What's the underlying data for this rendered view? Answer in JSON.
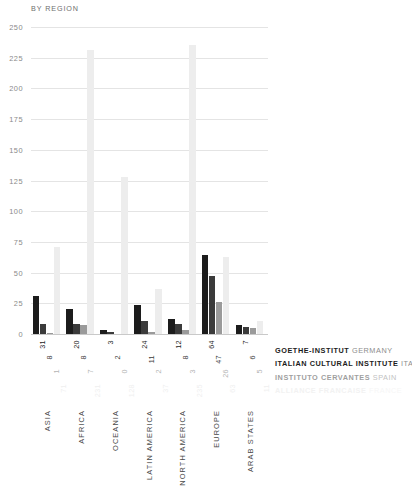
{
  "chart_data": {
    "type": "bar",
    "title": "BY REGION",
    "xlabel": "",
    "ylabel": "",
    "ylim": [
      0,
      250
    ],
    "yticks": [
      250,
      225,
      200,
      175,
      150,
      125,
      100,
      75,
      50,
      25,
      0
    ],
    "grid": true,
    "legend_position": "right-bottom",
    "categories": [
      "ASIA",
      "AFRICA",
      "OCEANIA",
      "LATIN AMERICA",
      "NORTH AMERICA",
      "EUROPE",
      "ARAB STATES"
    ],
    "series": [
      {
        "name": "GOETHE-INSTITUT",
        "country": "GERMANY",
        "color": "#1c1c1c",
        "values": [
          31,
          20,
          3,
          24,
          12,
          64,
          7
        ]
      },
      {
        "name": "ITALIAN CULTURAL INSTITUTE",
        "country": "ITALY",
        "color": "#3b3b3b",
        "values": [
          8,
          8,
          2,
          11,
          8,
          47,
          6
        ]
      },
      {
        "name": "INSTITUTO CERVANTES",
        "country": "SPAIN",
        "color": "#9a9a9a",
        "values": [
          1,
          7,
          0,
          2,
          3,
          26,
          5
        ]
      },
      {
        "name": "ALLIANCE FRANCAISE",
        "country": "FRANCE",
        "color": "#ededed",
        "values": [
          71,
          231,
          128,
          37,
          235,
          63,
          11
        ]
      }
    ]
  },
  "legend": [
    {
      "org": "GOETHE-INSTITUT",
      "country": "GERMANY"
    },
    {
      "org": "ITALIAN CULTURAL INSTITUTE",
      "country": "ITALY"
    },
    {
      "org": "INSTITUTO CERVANTES",
      "country": "SPAIN"
    },
    {
      "org": "ALLIANCE FRANCAISE",
      "country": "FRANCE"
    }
  ]
}
